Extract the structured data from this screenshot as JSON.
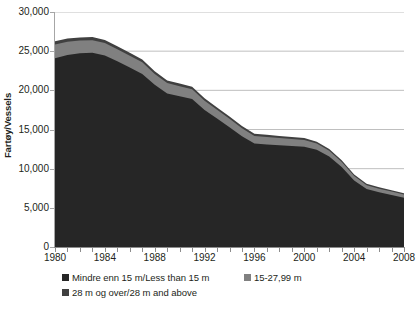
{
  "chart_data": {
    "type": "area",
    "stacked": true,
    "title": "",
    "xlabel": "",
    "ylabel": "Fartøy/Vessels",
    "ylim": [
      0,
      30000
    ],
    "ytick_values": [
      0,
      5000,
      10000,
      15000,
      20000,
      25000,
      30000
    ],
    "ytick_labels": [
      "0",
      "5,000",
      "10,000",
      "15,000",
      "20,000",
      "25,000",
      "30,000"
    ],
    "xlim": [
      1980,
      2008
    ],
    "x": [
      1980,
      1981,
      1982,
      1983,
      1984,
      1985,
      1986,
      1987,
      1988,
      1989,
      1990,
      1991,
      1992,
      1993,
      1994,
      1995,
      1996,
      1997,
      1998,
      1999,
      2000,
      2001,
      2002,
      2003,
      2004,
      2005,
      2006,
      2007,
      2008
    ],
    "xtick_values": [
      1980,
      1984,
      1988,
      1992,
      1996,
      2000,
      2004,
      2008
    ],
    "xtick_labels": [
      "1980",
      "1984",
      "1988",
      "1992",
      "1996",
      "2000",
      "2004",
      "2008"
    ],
    "grid": "horizontal",
    "legend_position": "bottom",
    "series": [
      {
        "name": "Mindre enn 15 m/Less than 15 m",
        "color": "#262626",
        "values": [
          24100,
          24500,
          24750,
          24800,
          24450,
          23700,
          22900,
          22100,
          20700,
          19600,
          19250,
          18900,
          17500,
          16400,
          15300,
          14150,
          13200,
          13100,
          13000,
          12900,
          12800,
          12400,
          11550,
          10200,
          8500,
          7400,
          7000,
          6650,
          6300
        ]
      },
      {
        "name": "15-27,99 m",
        "color": "#808080",
        "values": [
          1750,
          1700,
          1600,
          1600,
          1580,
          1550,
          1520,
          1480,
          1400,
          1330,
          1280,
          1230,
          1180,
          1120,
          1080,
          1020,
          980,
          950,
          920,
          890,
          860,
          800,
          740,
          660,
          560,
          480,
          440,
          420,
          400
        ]
      },
      {
        "name": "28 m og over/28 m and above",
        "color": "#404040",
        "values": [
          430,
          420,
          410,
          400,
          390,
          380,
          370,
          360,
          350,
          340,
          330,
          320,
          310,
          300,
          290,
          280,
          270,
          265,
          260,
          255,
          250,
          240,
          230,
          215,
          200,
          190,
          185,
          180,
          175
        ]
      }
    ],
    "totals": [
      26280,
      26620,
      26760,
      26800,
      26420,
      25630,
      24790,
      23940,
      22450,
      21270,
      20860,
      20450,
      18990,
      17820,
      16670,
      15450,
      14450,
      14315,
      14180,
      14045,
      13910,
      13440,
      12520,
      11075,
      9260,
      8070,
      7625,
      7250,
      6875
    ]
  },
  "axes": {
    "y_title": "Fartøy/Vessels"
  },
  "legend": {
    "items": [
      {
        "label": "Mindre enn 15 m/Less than 15 m",
        "color": "#262626"
      },
      {
        "label": "15-27,99 m",
        "color": "#808080"
      },
      {
        "label": "28 m og over/28 m and above",
        "color": "#404040"
      }
    ]
  },
  "style": {
    "gridline_color": "#bfbfbf",
    "axis_color": "#a6a6a6",
    "text_color": "#231f20",
    "plot_background": "#ffffff"
  }
}
